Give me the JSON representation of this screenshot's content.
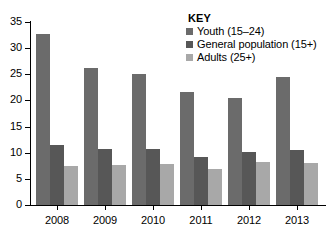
{
  "legend": {
    "title": "KEY",
    "entries": [
      {
        "label": "Youth (15–24)",
        "color": "#6b6b6b"
      },
      {
        "label": "General population (15+)",
        "color": "#575757"
      },
      {
        "label": "Adults (25+)",
        "color": "#a8a8a8"
      }
    ]
  },
  "axis": {
    "y_ticks": [
      "0",
      "5",
      "10",
      "15",
      "20",
      "25",
      "30",
      "35"
    ],
    "x_ticks": [
      "2008",
      "2009",
      "2010",
      "2011",
      "2012",
      "2013"
    ]
  },
  "chart_data": {
    "type": "bar",
    "title": "",
    "subtitle": "",
    "xlabel": "",
    "ylabel": "",
    "categories": [
      "2008",
      "2009",
      "2010",
      "2011",
      "2012",
      "2013"
    ],
    "series": [
      {
        "name": "Youth (15–24)",
        "color": "#6b6b6b",
        "values": [
          32.8,
          26.3,
          25.1,
          21.6,
          20.4,
          24.4
        ]
      },
      {
        "name": "General population (15+)",
        "color": "#575757",
        "values": [
          11.4,
          10.7,
          10.7,
          9.2,
          10.2,
          10.6
        ]
      },
      {
        "name": "Adults (25+)",
        "color": "#a8a8a8",
        "values": [
          7.4,
          7.6,
          7.9,
          6.8,
          8.3,
          8.0
        ]
      }
    ],
    "ylim": [
      0,
      35
    ],
    "ytick_step": 5,
    "grid": false,
    "legend_position": "top-right"
  }
}
